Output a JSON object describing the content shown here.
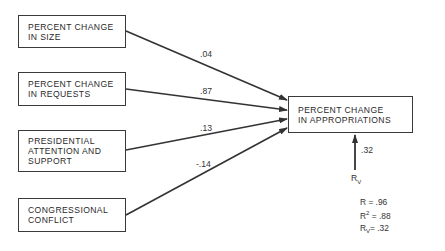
{
  "diagram": {
    "type": "path-diagram",
    "predictors": [
      {
        "id": "size",
        "lines": [
          "PERCENT CHANGE",
          "IN SIZE"
        ],
        "coefficient": ".04"
      },
      {
        "id": "requests",
        "lines": [
          "PERCENT CHANGE",
          "IN REQUESTS"
        ],
        "coefficient": ".87"
      },
      {
        "id": "presidential",
        "lines": [
          "PRESIDENTIAL",
          "ATTENTION AND",
          "SUPPORT"
        ],
        "coefficient": ".13"
      },
      {
        "id": "congressional",
        "lines": [
          "CONGRESSIONAL",
          "CONFLICT"
        ],
        "coefficient": "-.14"
      }
    ],
    "outcome": {
      "lines": [
        "PERCENT CHANGE",
        "IN APPROPRIATIONS"
      ]
    },
    "residual": {
      "label": "R",
      "subscript": "V",
      "coefficient": ".32"
    },
    "stats": [
      {
        "label": "R",
        "mod": "",
        "value": ".96"
      },
      {
        "label": "R",
        "mod": "2",
        "value": ".88"
      },
      {
        "label": "R",
        "mod": "V",
        "value": ".32"
      }
    ]
  }
}
